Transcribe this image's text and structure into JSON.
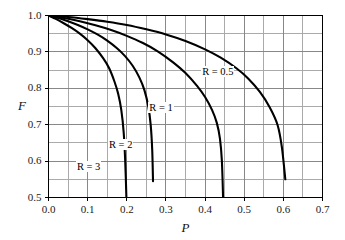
{
  "chart_data": {
    "type": "line",
    "title": "",
    "xlabel": "P",
    "ylabel": "F",
    "xlim": [
      0.0,
      0.7
    ],
    "ylim": [
      0.5,
      1.0
    ],
    "grid": true,
    "grid_major_x": 0.1,
    "grid_minor_x": 0.05,
    "grid_major_y": 0.1,
    "grid_minor_y": 0.05,
    "legend_position": "inline-labels",
    "xticks": [
      "0.0",
      "0.1",
      "0.2",
      "0.3",
      "0.4",
      "0.5",
      "0.6",
      "0.7"
    ],
    "xtick_values": [
      0.0,
      0.1,
      0.2,
      0.3,
      0.4,
      0.5,
      0.6,
      0.7
    ],
    "yticks": [
      "0.5",
      "0.6",
      "0.7",
      "0.8",
      "0.9",
      "1.0"
    ],
    "ytick_values": [
      0.5,
      0.6,
      0.7,
      0.8,
      0.9,
      1.0
    ],
    "series": [
      {
        "name": "R = 0.5",
        "label": "R = 0.5",
        "label_at": {
          "x": 0.39,
          "y": 0.845
        },
        "x": [
          0.0,
          0.05,
          0.1,
          0.15,
          0.2,
          0.25,
          0.3,
          0.35,
          0.4,
          0.44,
          0.48,
          0.51,
          0.54,
          0.565,
          0.585,
          0.596,
          0.605
        ],
        "y": [
          1.0,
          0.996,
          0.99,
          0.983,
          0.974,
          0.962,
          0.948,
          0.93,
          0.907,
          0.884,
          0.855,
          0.827,
          0.79,
          0.748,
          0.7,
          0.64,
          0.55
        ]
      },
      {
        "name": "R = 1",
        "label": "R = 1",
        "label_at": {
          "x": 0.255,
          "y": 0.745
        },
        "x": [
          0.0,
          0.04,
          0.08,
          0.12,
          0.16,
          0.2,
          0.24,
          0.28,
          0.32,
          0.35,
          0.38,
          0.4,
          0.418,
          0.43,
          0.438,
          0.443,
          0.446
        ],
        "y": [
          1.0,
          0.993,
          0.984,
          0.973,
          0.96,
          0.944,
          0.925,
          0.901,
          0.87,
          0.842,
          0.806,
          0.776,
          0.74,
          0.705,
          0.662,
          0.6,
          0.5
        ]
      },
      {
        "name": "R = 2",
        "label": "R = 2",
        "label_at": {
          "x": 0.152,
          "y": 0.645
        },
        "x": [
          0.0,
          0.025,
          0.05,
          0.075,
          0.1,
          0.125,
          0.15,
          0.175,
          0.195,
          0.215,
          0.232,
          0.245,
          0.255,
          0.261,
          0.265,
          0.267
        ],
        "y": [
          1.0,
          0.993,
          0.984,
          0.974,
          0.962,
          0.948,
          0.931,
          0.91,
          0.889,
          0.862,
          0.83,
          0.795,
          0.75,
          0.7,
          0.63,
          0.545
        ]
      },
      {
        "name": "R = 3",
        "label": "R = 3",
        "label_at": {
          "x": 0.07,
          "y": 0.585
        },
        "x": [
          0.0,
          0.02,
          0.04,
          0.06,
          0.08,
          0.1,
          0.12,
          0.14,
          0.155,
          0.168,
          0.178,
          0.186,
          0.192,
          0.196,
          0.199
        ],
        "y": [
          1.0,
          0.99,
          0.978,
          0.965,
          0.95,
          0.932,
          0.91,
          0.882,
          0.855,
          0.82,
          0.785,
          0.74,
          0.68,
          0.6,
          0.5
        ]
      }
    ],
    "colors": {
      "curve": "#000000",
      "grid_major": "#888888",
      "grid_minor": "#aaaaaa",
      "frame": "#000000",
      "text": "#111111",
      "background": "#ffffff"
    }
  }
}
